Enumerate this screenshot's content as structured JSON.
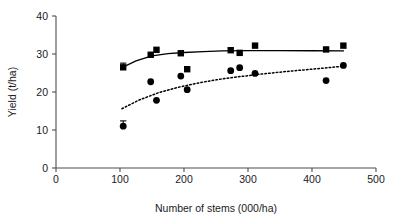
{
  "chart_data": {
    "type": "scatter",
    "title": "",
    "xlabel": "Number of stems (000/ha)",
    "ylabel": "Yield (t/ha)",
    "xlim": [
      0,
      500
    ],
    "ylim": [
      0,
      40
    ],
    "xticks": [
      0,
      100,
      200,
      300,
      400,
      500
    ],
    "yticks": [
      0,
      10,
      20,
      30,
      40
    ],
    "xticklabels": [
      "0",
      "100",
      "200",
      "300",
      "400",
      "500"
    ],
    "yticklabels": [
      "0",
      "10",
      "20",
      "30",
      "40"
    ],
    "grid": false,
    "legend": "none",
    "series": [
      {
        "name": "square-series",
        "marker": "square",
        "fit_line_style": "solid",
        "points": [
          {
            "x": 105,
            "y": 26.5,
            "yerr": 1.1
          },
          {
            "x": 148,
            "y": 29.8
          },
          {
            "x": 157,
            "y": 31.1
          },
          {
            "x": 195,
            "y": 30.2
          },
          {
            "x": 205,
            "y": 26.0
          },
          {
            "x": 273,
            "y": 31.0
          },
          {
            "x": 287,
            "y": 30.3
          },
          {
            "x": 311,
            "y": 32.2
          },
          {
            "x": 422,
            "y": 31.2
          },
          {
            "x": 449,
            "y": 32.2
          }
        ],
        "fit_curve": [
          {
            "x": 103,
            "y": 26.4
          },
          {
            "x": 125,
            "y": 28.2
          },
          {
            "x": 150,
            "y": 29.5
          },
          {
            "x": 175,
            "y": 30.1
          },
          {
            "x": 200,
            "y": 30.4
          },
          {
            "x": 230,
            "y": 30.6
          },
          {
            "x": 260,
            "y": 30.8
          },
          {
            "x": 300,
            "y": 30.9
          },
          {
            "x": 350,
            "y": 30.9
          },
          {
            "x": 400,
            "y": 30.85
          },
          {
            "x": 450,
            "y": 30.8
          }
        ]
      },
      {
        "name": "circle-series",
        "marker": "circle",
        "fit_line_style": "dotted",
        "points": [
          {
            "x": 105,
            "y": 11.0,
            "yerr": 1.4
          },
          {
            "x": 148,
            "y": 22.7
          },
          {
            "x": 157,
            "y": 17.8
          },
          {
            "x": 195,
            "y": 24.2
          },
          {
            "x": 205,
            "y": 20.6
          },
          {
            "x": 273,
            "y": 25.6
          },
          {
            "x": 287,
            "y": 26.4
          },
          {
            "x": 311,
            "y": 24.9
          },
          {
            "x": 422,
            "y": 23.0
          },
          {
            "x": 449,
            "y": 27.0
          }
        ],
        "fit_curve": [
          {
            "x": 103,
            "y": 15.6
          },
          {
            "x": 130,
            "y": 17.9
          },
          {
            "x": 160,
            "y": 19.8
          },
          {
            "x": 190,
            "y": 21.2
          },
          {
            "x": 220,
            "y": 22.3
          },
          {
            "x": 250,
            "y": 23.2
          },
          {
            "x": 280,
            "y": 23.9
          },
          {
            "x": 320,
            "y": 24.7
          },
          {
            "x": 360,
            "y": 25.4
          },
          {
            "x": 400,
            "y": 26.0
          },
          {
            "x": 450,
            "y": 26.8
          }
        ]
      }
    ]
  }
}
